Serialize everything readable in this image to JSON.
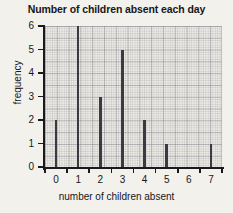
{
  "chart_data": {
    "type": "bar",
    "title": "Number of children absent each day",
    "xlabel": "number of children absent",
    "ylabel": "frequency",
    "categories": [
      "0",
      "1",
      "2",
      "3",
      "4",
      "5",
      "6",
      "7"
    ],
    "values": [
      2,
      6,
      3,
      5,
      2,
      1,
      0,
      1
    ],
    "x_tick_labels": [
      "0",
      "1",
      "2",
      "3",
      "4",
      "5",
      "6",
      "7"
    ],
    "y_tick_labels": [
      "0",
      "1",
      "2",
      "3",
      "4",
      "5",
      "6"
    ],
    "y_tick_values": [
      0,
      1,
      2,
      3,
      4,
      5,
      6
    ],
    "xlim": [
      -0.5,
      7.5
    ],
    "ylim": [
      0,
      6
    ],
    "grid": true,
    "grid_style": "graph-paper",
    "legend": false,
    "bar_color": "#3a3a40",
    "axis_color": "#1a1a1e",
    "plot_background": "#eceae5",
    "page_background": "#f3f1ec",
    "text_color": "#17161a"
  }
}
